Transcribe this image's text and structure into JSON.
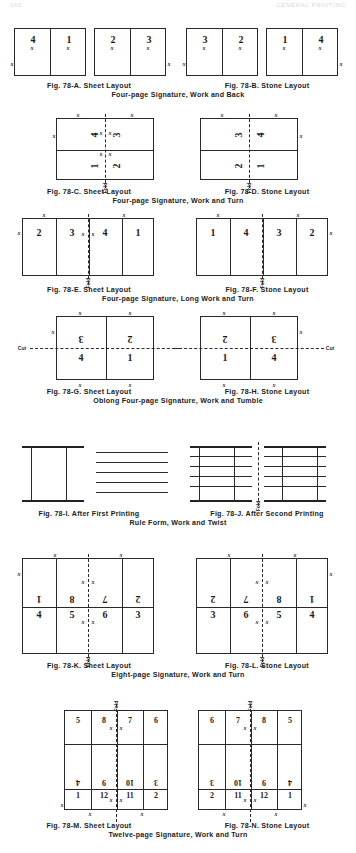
{
  "running_head": {
    "folio": "160",
    "title": "GENERAL PRINTING"
  },
  "marks": {
    "x": "x",
    "fold": "Fold",
    "cut": "Cut"
  },
  "sections": [
    {
      "id": "ab",
      "caption_left": "Fig. 78-A.  Sheet Layout",
      "caption_right": "Fig. 78-B.  Stone Layout",
      "caption_sub": "Four-page Signature, Work and Back",
      "figures": [
        {
          "id": "78-A",
          "cells": [
            "4",
            "1"
          ]
        },
        {
          "id": "78-A2",
          "cells": [
            "2",
            "3"
          ]
        },
        {
          "id": "78-B",
          "cells": [
            "3",
            "2"
          ]
        },
        {
          "id": "78-B2",
          "cells": [
            "1",
            "4"
          ]
        }
      ]
    },
    {
      "id": "cd",
      "caption_left": "Fig. 78-C.  Sheet Layout",
      "caption_right": "Fig. 78-D. Stone Layout",
      "caption_sub": "Four-page Signature, Work and Turn",
      "figures": [
        {
          "id": "78-C",
          "top": [
            "4",
            "3"
          ],
          "bottom": [
            "1",
            "2"
          ]
        },
        {
          "id": "78-D",
          "top": [
            "3",
            "4"
          ],
          "bottom": [
            "2",
            "1"
          ]
        }
      ]
    },
    {
      "id": "ef",
      "caption_left": "Fig. 78-E.  Sheet Layout",
      "caption_right": "Fig. 78-F.  Stone Layout",
      "caption_sub": "Four-page Signature, Long Work and Turn",
      "figures": [
        {
          "id": "78-E",
          "cells": [
            "2",
            "3",
            "4",
            "1"
          ]
        },
        {
          "id": "78-F",
          "cells": [
            "1",
            "4",
            "3",
            "2"
          ]
        }
      ]
    },
    {
      "id": "gh",
      "caption_left": "Fig. 78-G.  Sheet Layout",
      "caption_right": "Fig. 78-H.  Stone Layout",
      "caption_sub": "Oblong Four-page Signature, Work and Tumble",
      "figures": [
        {
          "id": "78-G",
          "top": [
            "3",
            "2"
          ],
          "bottom": [
            "4",
            "1"
          ]
        },
        {
          "id": "78-H",
          "top": [
            "2",
            "3"
          ],
          "bottom": [
            "1",
            "4"
          ]
        }
      ]
    },
    {
      "id": "ij",
      "caption_left": "Fig. 78-I.  After First Printing",
      "caption_right": "Fig. 78-J.  After Second Printing",
      "caption_sub": "Rule Form, Work and Twist",
      "figures": [
        {
          "id": "78-I",
          "kind": "rule-form-first"
        },
        {
          "id": "78-J",
          "kind": "rule-form-second"
        }
      ]
    },
    {
      "id": "kl",
      "caption_left": "Fig. 78-K.  Sheet Layout",
      "caption_right": "Fig. 78-L.  Stone Layout",
      "caption_sub": "Eight-page Signature, Work and Turn",
      "figures": [
        {
          "id": "78-K",
          "top": [
            "1",
            "8",
            "7",
            "2"
          ],
          "bottom": [
            "4",
            "5",
            "6",
            "3"
          ]
        },
        {
          "id": "78-L",
          "top": [
            "2",
            "7",
            "8",
            "1"
          ],
          "bottom": [
            "3",
            "6",
            "5",
            "4"
          ]
        }
      ]
    },
    {
      "id": "mn",
      "caption_left": "Fig. 78-M.  Sheet Layout",
      "caption_right": "Fig. 78-N.  Stone Layout",
      "caption_sub": "Twelve-page Signature, Work and Turn",
      "figures": [
        {
          "id": "78-M",
          "row1": [
            "5",
            "8",
            "7",
            "6"
          ],
          "row2": [
            "4",
            "9",
            "10",
            "3"
          ],
          "row3": [
            "1",
            "12",
            "11",
            "2"
          ]
        },
        {
          "id": "78-N",
          "row1": [
            "6",
            "7",
            "8",
            "5"
          ],
          "row2": [
            "3",
            "10",
            "9",
            "4"
          ],
          "row3": [
            "2",
            "11",
            "12",
            "1"
          ]
        }
      ]
    }
  ]
}
